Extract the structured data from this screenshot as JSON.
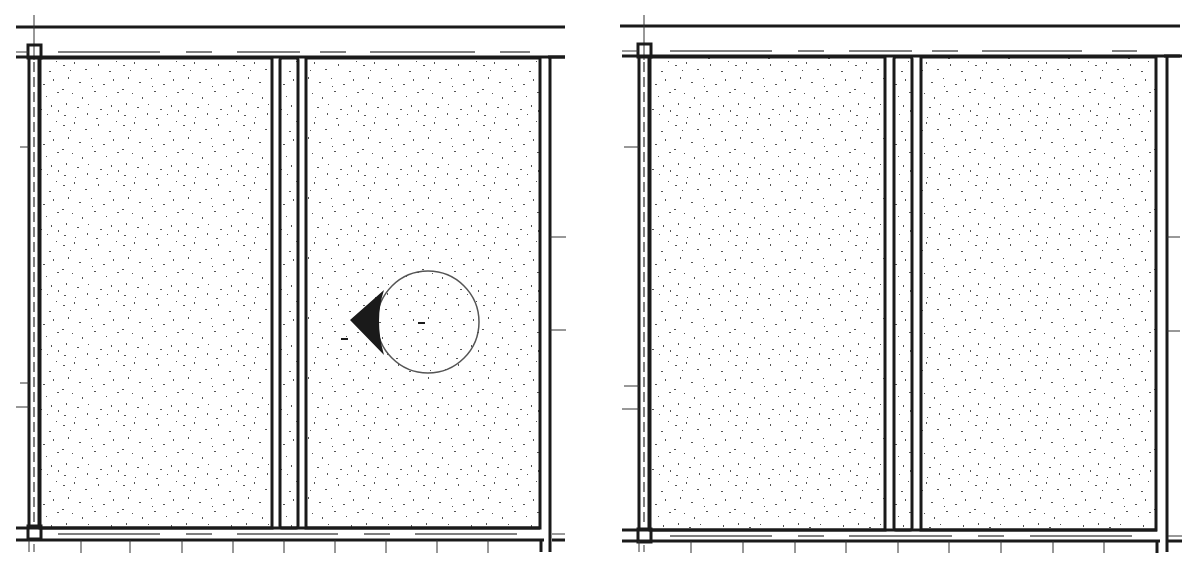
{
  "drawing": {
    "type": "architectural-plan-detail",
    "panels": [
      {
        "id": "left",
        "offset_x": 0,
        "has_marker": true,
        "marker": {
          "cx": 428,
          "cy": 322,
          "r": 51,
          "symbol": "section-callout-arrow-left"
        }
      },
      {
        "id": "right",
        "offset_x": 612,
        "has_marker": false
      }
    ],
    "colors": {
      "line": "#1a1a1a",
      "fill_stipple": "#555555",
      "background": "#ffffff"
    },
    "bottom_ticks_x": [
      81,
      130,
      182,
      233,
      284,
      335,
      386,
      437,
      488
    ],
    "left_ticks_y": [
      147,
      383,
      407
    ],
    "right_ticks_y": [
      237,
      330
    ]
  }
}
